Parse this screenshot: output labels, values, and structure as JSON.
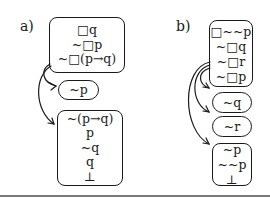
{
  "panels": [
    {
      "label": "a)",
      "nodes": [
        {
          "id": "a1",
          "lines": [
            "□q",
            "~□p",
            "~□(p→q)"
          ]
        },
        {
          "id": "a2",
          "lines": [
            "~p"
          ]
        },
        {
          "id": "a3",
          "lines": [
            "~(p→q)",
            "p",
            "~q",
            "q",
            "⊥"
          ]
        }
      ],
      "edges": [
        {
          "from": "a1",
          "to": "a2"
        },
        {
          "from": "a1",
          "to": "a3"
        }
      ]
    },
    {
      "label": "b)",
      "nodes": [
        {
          "id": "b1",
          "lines": [
            "□~~p",
            "~□q",
            "~□r",
            "~□p"
          ]
        },
        {
          "id": "b2",
          "lines": [
            "~q"
          ]
        },
        {
          "id": "b3",
          "lines": [
            "~r"
          ]
        },
        {
          "id": "b4",
          "lines": [
            "~p",
            "~~p",
            "⊥"
          ]
        }
      ],
      "edges": [
        {
          "from": "b1",
          "to": "b2"
        },
        {
          "from": "b1",
          "to": "b3"
        },
        {
          "from": "b1",
          "to": "b4"
        }
      ]
    }
  ],
  "colors": {
    "stroke": "#1a1a1a",
    "rule": "#7a7a7a",
    "background": "#ffffff"
  }
}
